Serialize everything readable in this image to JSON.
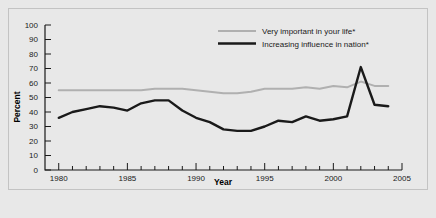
{
  "chart_data": {
    "type": "line",
    "title": "",
    "xlabel": "Year",
    "ylabel": "Percent",
    "xlim": [
      1979,
      2005
    ],
    "ylim": [
      0,
      100
    ],
    "grid": false,
    "legend_position": "top-right",
    "x_ticks_major": [
      1980,
      1985,
      1990,
      1995,
      2000,
      2005
    ],
    "x_tick_labels": [
      "1980",
      "1985",
      "1990",
      "1995",
      "2000",
      "2005"
    ],
    "y_ticks": [
      0,
      10,
      20,
      30,
      40,
      50,
      60,
      70,
      80,
      90,
      100
    ],
    "y_tick_labels": [
      "0",
      "10",
      "20",
      "30",
      "40",
      "50",
      "60",
      "70",
      "80",
      "90",
      "100"
    ],
    "x": [
      1980,
      1981,
      1982,
      1983,
      1984,
      1985,
      1986,
      1987,
      1988,
      1989,
      1990,
      1991,
      1992,
      1993,
      1994,
      1995,
      1996,
      1997,
      1998,
      1999,
      2000,
      2001,
      2002,
      2003,
      2004
    ],
    "series": [
      {
        "name": "Very important in your life*",
        "color": "#b0b0b0",
        "width": 2.0,
        "values": [
          55,
          55,
          55,
          55,
          55,
          55,
          55,
          56,
          56,
          56,
          55,
          54,
          53,
          53,
          54,
          56,
          56,
          56,
          57,
          56,
          58,
          57,
          61,
          58,
          58
        ]
      },
      {
        "name": "Increasing influence in nation*",
        "color": "#1a1a1a",
        "width": 2.4,
        "values": [
          36,
          40,
          42,
          44,
          43,
          41,
          46,
          48,
          48,
          41,
          36,
          33,
          28,
          27,
          27,
          30,
          34,
          33,
          37,
          34,
          35,
          37,
          71,
          45,
          44
        ]
      }
    ],
    "footnote_marker": "*"
  },
  "legend": {
    "items": [
      {
        "label": "Very important in your life*",
        "swatch": "gray-line-swatch"
      },
      {
        "label": "Increasing influence in nation*",
        "swatch": "black-line-swatch"
      }
    ]
  },
  "axes": {
    "y_title": "Percent",
    "x_title": "Year"
  },
  "colors": {
    "background": "#e8e8e8",
    "frame": "#c3c3c3",
    "axis": "#1a1a1a",
    "series_gray": "#b0b0b0",
    "series_black": "#1a1a1a"
  }
}
